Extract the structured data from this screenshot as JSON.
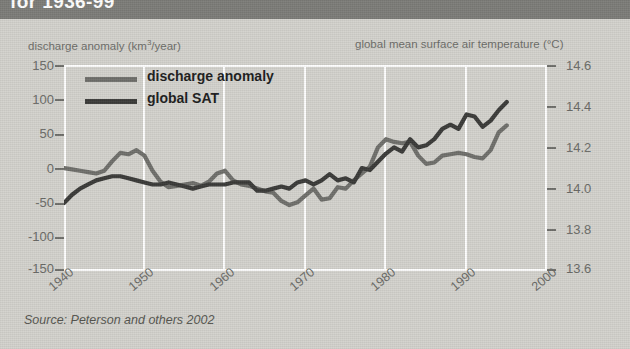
{
  "header": {
    "title": "for 1936-99"
  },
  "axis_titles": {
    "left": "discharge anomaly (km3/year)",
    "left_main": "discharge anomaly (km",
    "left_sup": "3",
    "left_tail": "/year)",
    "right": "global mean surface air temperature (°C)"
  },
  "legend": {
    "items": [
      {
        "label": "discharge anomaly",
        "color": "#6f6f6b"
      },
      {
        "label": "global SAT",
        "color": "#3a3a38"
      }
    ]
  },
  "source": "Source: Peterson and others 2002",
  "colors": {
    "title_bar": "#7c7c78",
    "background": "#d3d2cd",
    "grid": "#ffffff",
    "discharge": "#6f6f6b",
    "sat": "#3a3a38",
    "tick_text": "#6a6a66"
  },
  "chart_data": {
    "type": "line",
    "title": "for 1936-99",
    "xlabel": "",
    "ylabel": "discharge anomaly (km3/year)",
    "y2label": "global mean surface air temperature (°C)",
    "xlim": [
      1940,
      2000
    ],
    "ylim": [
      -150,
      150
    ],
    "y2lim": [
      13.6,
      14.6
    ],
    "xticks": [
      1940,
      1950,
      1960,
      1970,
      1980,
      1990,
      2000
    ],
    "xticklabels": [
      "1940",
      "1950",
      "1960",
      "1970",
      "1980",
      "1990",
      "2000"
    ],
    "yticks": [
      -150,
      -100,
      -50,
      0,
      50,
      100,
      150
    ],
    "yticklabels": [
      "-150",
      "-100",
      "-50",
      "0",
      "50",
      "100",
      "150"
    ],
    "y2ticks": [
      13.6,
      13.8,
      14.0,
      14.2,
      14.4,
      14.6
    ],
    "y2ticklabels": [
      "13.6",
      "13.8",
      "14.0",
      "14.2",
      "14.4",
      "14.6"
    ],
    "grid": "vertical-only",
    "legend_position": "upper-left",
    "series": [
      {
        "name": "discharge anomaly",
        "axis": "left",
        "color": "#6f6f6b",
        "x": [
          1940,
          1941,
          1942,
          1943,
          1944,
          1945,
          1946,
          1947,
          1948,
          1949,
          1950,
          1951,
          1952,
          1953,
          1954,
          1955,
          1956,
          1957,
          1958,
          1959,
          1960,
          1961,
          1962,
          1963,
          1964,
          1965,
          1966,
          1967,
          1968,
          1969,
          1970,
          1971,
          1972,
          1973,
          1974,
          1975,
          1976,
          1977,
          1978,
          1979,
          1980,
          1981,
          1982,
          1983,
          1984,
          1985,
          1986,
          1987,
          1988,
          1989,
          1990,
          1991,
          1992,
          1993,
          1994,
          1995
        ],
        "values": [
          0,
          -2,
          -4,
          -6,
          -8,
          -4,
          10,
          22,
          20,
          26,
          18,
          -4,
          -20,
          -28,
          -26,
          -24,
          -22,
          -26,
          -20,
          -8,
          -4,
          -18,
          -24,
          -26,
          -30,
          -34,
          -36,
          -48,
          -54,
          -50,
          -40,
          -30,
          -46,
          -44,
          -28,
          -30,
          -18,
          -8,
          2,
          30,
          42,
          38,
          36,
          38,
          18,
          6,
          8,
          18,
          20,
          22,
          20,
          16,
          14,
          26,
          52,
          62
        ]
      },
      {
        "name": "global SAT",
        "axis": "right",
        "color": "#3a3a38",
        "x": [
          1940,
          1941,
          1942,
          1943,
          1944,
          1945,
          1946,
          1947,
          1948,
          1949,
          1950,
          1951,
          1952,
          1953,
          1954,
          1955,
          1956,
          1957,
          1958,
          1959,
          1960,
          1961,
          1962,
          1963,
          1964,
          1965,
          1966,
          1967,
          1968,
          1969,
          1970,
          1971,
          1972,
          1973,
          1974,
          1975,
          1976,
          1977,
          1978,
          1979,
          1980,
          1981,
          1982,
          1983,
          1984,
          1985,
          1986,
          1987,
          1988,
          1989,
          1990,
          1991,
          1992,
          1993,
          1994,
          1995
        ],
        "values": [
          13.93,
          13.97,
          14.0,
          14.02,
          14.04,
          14.05,
          14.06,
          14.06,
          14.05,
          14.04,
          14.03,
          14.02,
          14.02,
          14.03,
          14.02,
          14.01,
          14.0,
          14.01,
          14.02,
          14.02,
          14.02,
          14.03,
          14.03,
          14.03,
          13.99,
          13.99,
          14.0,
          14.01,
          14.0,
          14.03,
          14.04,
          14.02,
          14.04,
          14.07,
          14.04,
          14.05,
          14.03,
          14.1,
          14.09,
          14.13,
          14.17,
          14.2,
          14.18,
          14.24,
          14.2,
          14.21,
          14.24,
          14.29,
          14.31,
          14.29,
          14.36,
          14.35,
          14.3,
          14.33,
          14.38,
          14.42
        ]
      }
    ]
  }
}
